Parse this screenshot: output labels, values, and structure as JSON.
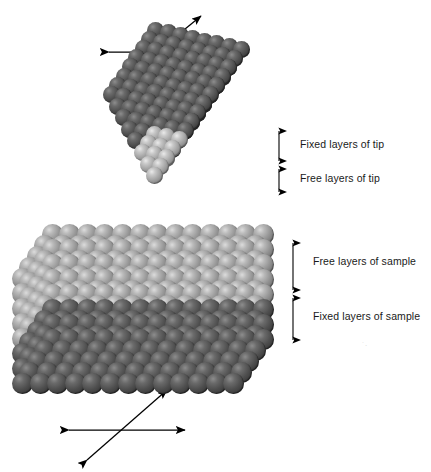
{
  "figure": {
    "background_color": "#ffffff",
    "width": 431,
    "height": 472
  },
  "colors": {
    "fixed_atom": "#4a4a4a",
    "free_atom_tip": "#9a9a9a",
    "free_atom_sample": "#8f8f8f",
    "arrow": "#000000",
    "label_text": "#1a1a1a"
  },
  "labels": {
    "fixed_layers_of_tip": "Fixed layers of tip",
    "free_layers_of_tip": "Free layers of tip",
    "free_layers_of_sample": "Free layers of sample",
    "fixed_layers_of_sample": "Fixed layers of sample"
  },
  "tip": {
    "name": "tip-cluster",
    "shape": "inverted-pyramid",
    "fixed_rows": 5,
    "free_rows": 3,
    "columns": 8
  },
  "sample": {
    "name": "sample-slab",
    "shape": "perspective-slab",
    "free_rows": 5,
    "fixed_rows": 3,
    "columns": 13
  },
  "arrow_crosses": [
    {
      "name": "scan-axes-top",
      "position": "above-tip"
    },
    {
      "name": "scan-axes-bottom",
      "position": "below-sample"
    }
  ],
  "brackets": [
    {
      "name": "bracket-fixed-tip",
      "label_key": "fixed_layers_of_tip"
    },
    {
      "name": "bracket-free-tip",
      "label_key": "free_layers_of_tip"
    },
    {
      "name": "bracket-free-sample",
      "label_key": "free_layers_of_sample"
    },
    {
      "name": "bracket-fixed-sample",
      "label_key": "fixed_layers_of_sample"
    }
  ],
  "artifact": {
    "text": "˙·"
  }
}
